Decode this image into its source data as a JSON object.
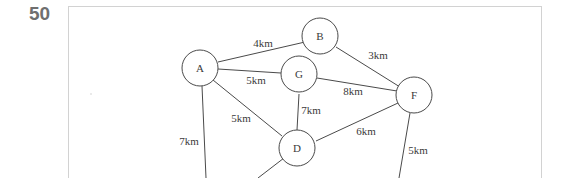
{
  "question": {
    "number": "50"
  },
  "graph": {
    "nodes": [
      {
        "id": "A",
        "label": "A"
      },
      {
        "id": "B",
        "label": "B"
      },
      {
        "id": "G",
        "label": "G"
      },
      {
        "id": "F",
        "label": "F"
      },
      {
        "id": "D",
        "label": "D"
      }
    ],
    "edges": [
      {
        "from": "A",
        "to": "B",
        "label": "4km"
      },
      {
        "from": "A",
        "to": "G",
        "label": "5km"
      },
      {
        "from": "B",
        "to": "F",
        "label": "3km"
      },
      {
        "from": "G",
        "to": "F",
        "label": "8km"
      },
      {
        "from": "G",
        "to": "D",
        "label": "7km"
      },
      {
        "from": "A",
        "to": "D",
        "label": "5km"
      },
      {
        "from": "D",
        "to": "F",
        "label": "6km"
      },
      {
        "from": "A",
        "to": "off-bottom",
        "label": "7km"
      },
      {
        "from": "F",
        "to": "off-bottom",
        "label": "5km"
      },
      {
        "from": "D",
        "to": "off-bottom",
        "label": ""
      }
    ]
  }
}
